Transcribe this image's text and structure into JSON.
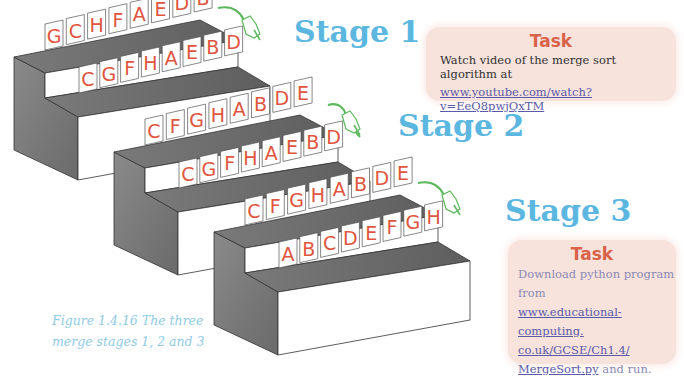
{
  "figure": {
    "caption_line1": "Figure 1.4.16 The three",
    "caption_line2": "merge stages 1, 2 and 3",
    "colors": {
      "stage_label": "#5bb7df",
      "card_letter": "#e0553e",
      "task_title": "#d9624a",
      "task_bg": "#f7e2dc",
      "link": "#5a5aa8",
      "caption": "#8fcbe8",
      "arrow": "#5cb85c",
      "step_dark": "#7a7a7a",
      "step_top": "#6e6e6e"
    },
    "stages": [
      {
        "label": "Stage 1",
        "top_row": [
          "G",
          "C",
          "H",
          "F",
          "A",
          "E",
          "D",
          "B"
        ],
        "bottom_row": [
          "C",
          "G",
          "F",
          "H",
          "A",
          "E",
          "B",
          "D"
        ],
        "icon": "pointing-hand-icon"
      },
      {
        "label": "Stage 2",
        "top_row": [
          "C",
          "F",
          "G",
          "H",
          "A",
          "B",
          "D",
          "E"
        ],
        "bottom_row": [
          "C",
          "G",
          "F",
          "H",
          "A",
          "E",
          "B",
          "D"
        ],
        "icon": "pointing-hand-icon"
      },
      {
        "label": "Stage 3",
        "top_row": [
          "C",
          "F",
          "G",
          "H",
          "A",
          "B",
          "D",
          "E"
        ],
        "bottom_row": [
          "A",
          "B",
          "C",
          "D",
          "E",
          "F",
          "G",
          "H"
        ],
        "icon": "pointing-hand-icon"
      }
    ]
  },
  "task1": {
    "title": "Task",
    "text": "Watch video of the merge sort algorithm at",
    "link": "www.youtube.com/watch?v=EeQ8pwjQxTM"
  },
  "task2": {
    "title": "Task",
    "text_line1": "Download python program",
    "text_line2": "from",
    "link_line1": "www.educational-computing.",
    "link_line2": "co.uk/GCSE/Ch1.4/",
    "link_line3": "MergeSort.py",
    "text_after_link": " and run."
  }
}
